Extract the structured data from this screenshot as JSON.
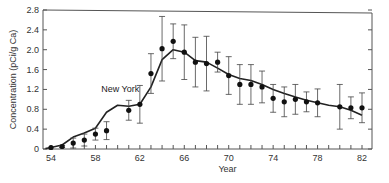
{
  "chart_data": {
    "type": "line",
    "title": "",
    "xlabel": "Year",
    "ylabel": "Concentration (pCi/g Ca)",
    "xlim": [
      53.5,
      83
    ],
    "ylim": [
      0,
      2.8
    ],
    "grid": false,
    "x_ticks": [
      54,
      58,
      62,
      66,
      70,
      74,
      78,
      82
    ],
    "y_ticks": [
      0,
      0.4,
      0.8,
      1.2,
      1.6,
      2.0,
      2.4,
      2.8
    ],
    "y_tick_labels": [
      "0",
      "0.4",
      "0.8",
      "1.2",
      "1.6",
      "2.0",
      "2.4",
      "2.8"
    ],
    "annotations": [
      {
        "text": "New York",
        "x": 60.5,
        "y": 1.2
      }
    ],
    "series": [
      {
        "name": "Model",
        "style": "line",
        "x": [
          53.5,
          54,
          55,
          56,
          57,
          58,
          59,
          60,
          61,
          62,
          63,
          64,
          65,
          66,
          67,
          68,
          69,
          70,
          71,
          72,
          73,
          74,
          75,
          76,
          77,
          78,
          79,
          80,
          81,
          82
        ],
        "y": [
          0.01,
          0.03,
          0.08,
          0.24,
          0.32,
          0.42,
          0.74,
          0.88,
          0.86,
          0.9,
          1.25,
          1.8,
          2.0,
          1.95,
          1.78,
          1.75,
          1.63,
          1.5,
          1.42,
          1.38,
          1.3,
          1.2,
          1.12,
          1.05,
          0.98,
          0.93,
          0.88,
          0.85,
          0.78,
          0.68
        ]
      },
      {
        "name": "New York (measured)",
        "style": "points-errorbars",
        "x": [
          54,
          55,
          56,
          57,
          58,
          59,
          61,
          62,
          63,
          64,
          65,
          66,
          67,
          68,
          69,
          70,
          71,
          72,
          73,
          74,
          75,
          76,
          77,
          78,
          80,
          81,
          82
        ],
        "y": [
          0.03,
          0.05,
          0.12,
          0.18,
          0.3,
          0.37,
          0.78,
          0.9,
          1.52,
          2.02,
          2.17,
          1.95,
          1.75,
          1.72,
          1.75,
          1.48,
          1.3,
          1.3,
          1.25,
          1.02,
          0.95,
          1.0,
          0.95,
          0.93,
          0.85,
          0.83,
          0.83
        ],
        "err": [
          0.0,
          0.02,
          0.1,
          0.12,
          0.12,
          0.18,
          0.2,
          0.38,
          0.4,
          0.65,
          0.35,
          0.55,
          0.5,
          0.55,
          0.2,
          0.38,
          0.4,
          0.4,
          0.32,
          0.28,
          0.3,
          0.3,
          0.2,
          0.28,
          0.45,
          0.22,
          0.3
        ]
      }
    ]
  }
}
